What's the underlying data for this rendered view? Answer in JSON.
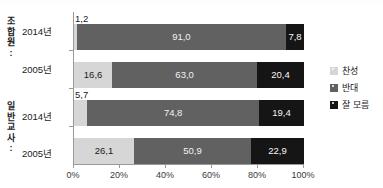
{
  "chart_data": {
    "type": "bar",
    "orientation": "horizontal",
    "stacked": true,
    "normalized_percent": true,
    "title": "",
    "xlabel": "",
    "ylabel": "",
    "xlim": [
      0,
      100
    ],
    "xticks": [
      "0%",
      "20%",
      "40%",
      "60%",
      "80%",
      "100%"
    ],
    "xtick_values": [
      0,
      20,
      40,
      60,
      80,
      100
    ],
    "grid": false,
    "legend_position": "right",
    "decimal_separator": ",",
    "groups": [
      {
        "name": "조합원",
        "name_chars": [
          "조",
          "합",
          "원",
          ":"
        ],
        "categories": [
          "2014년",
          "2005년"
        ]
      },
      {
        "name": "일반교사",
        "name_chars": [
          "일",
          "반",
          "교",
          "사",
          ":"
        ],
        "categories": [
          "2014년",
          "2005년"
        ]
      }
    ],
    "categories": [
      "2014년",
      "2005년",
      "2014년",
      "2005년"
    ],
    "series": [
      {
        "name": "찬성",
        "color": "#d6d6d6",
        "values": [
          1.2,
          16.6,
          5.7,
          26.1
        ]
      },
      {
        "name": "반대",
        "color": "#616161",
        "values": [
          91.0,
          63.0,
          74.8,
          50.9
        ]
      },
      {
        "name": "잘 모름",
        "color": "#151515",
        "values": [
          7.8,
          20.4,
          19.4,
          22.9
        ]
      }
    ],
    "bars": [
      {
        "group": "조합원",
        "category": "2014년",
        "segments": [
          {
            "series": "찬성",
            "value": 1.2,
            "label": "1,2",
            "label_position": "outside"
          },
          {
            "series": "반대",
            "value": 91.0,
            "label": "91,0",
            "label_position": "inside"
          },
          {
            "series": "잘 모름",
            "value": 7.8,
            "label": "7,8",
            "label_position": "inside"
          }
        ]
      },
      {
        "group": "조합원",
        "category": "2005년",
        "segments": [
          {
            "series": "찬성",
            "value": 16.6,
            "label": "16,6",
            "label_position": "inside"
          },
          {
            "series": "반대",
            "value": 63.0,
            "label": "63,0",
            "label_position": "inside"
          },
          {
            "series": "잘 모름",
            "value": 20.4,
            "label": "20,4",
            "label_position": "inside"
          }
        ]
      },
      {
        "group": "일반교사",
        "category": "2014년",
        "segments": [
          {
            "series": "찬성",
            "value": 5.7,
            "label": "5,7",
            "label_position": "outside"
          },
          {
            "series": "반대",
            "value": 74.8,
            "label": "74,8",
            "label_position": "inside"
          },
          {
            "series": "잘 모름",
            "value": 19.4,
            "label": "19,4",
            "label_position": "inside"
          }
        ]
      },
      {
        "group": "일반교사",
        "category": "2005년",
        "segments": [
          {
            "series": "찬성",
            "value": 26.1,
            "label": "26,1",
            "label_position": "inside"
          },
          {
            "series": "반대",
            "value": 50.9,
            "label": "50,9",
            "label_position": "inside"
          },
          {
            "series": "잘 모름",
            "value": 22.9,
            "label": "22,9",
            "label_position": "inside"
          }
        ]
      }
    ],
    "legend": [
      {
        "label": "찬성",
        "color": "#d6d6d6"
      },
      {
        "label": "반대",
        "color": "#616161"
      },
      {
        "label": "잘 모름",
        "color": "#151515"
      }
    ]
  }
}
